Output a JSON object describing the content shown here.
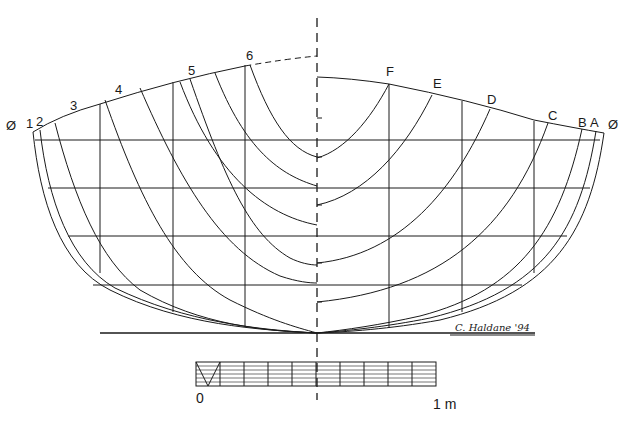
{
  "drawing": {
    "type": "body-plan-hull-lines",
    "ink_color": "#1a1a1a",
    "background": "#ffffff",
    "aft_half": {
      "centerline_mark_left": "Ø",
      "station_labels": [
        "1",
        "2",
        "3",
        "4",
        "5",
        "6"
      ]
    },
    "forward_half": {
      "centerline_mark_right": "Ø",
      "station_labels": [
        "A",
        "B",
        "C",
        "D",
        "E",
        "F"
      ]
    },
    "signature": "C. Haldane '94",
    "scale_bar": {
      "start_label": "0",
      "end_label": "1 m",
      "divisions": 10
    }
  }
}
